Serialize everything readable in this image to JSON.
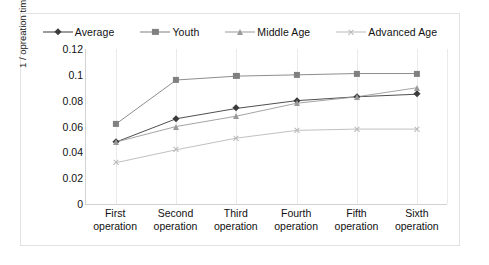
{
  "chart_data": {
    "type": "line",
    "title": "",
    "xlabel": "",
    "ylabel": "1 / opreation time (sec)",
    "categories": [
      "First operation",
      "Second operation",
      "Third operation",
      "Fourth operation",
      "Fifth operation",
      "Sixth operation"
    ],
    "category_lines": [
      [
        "First",
        "operation"
      ],
      [
        "Second",
        "operation"
      ],
      [
        "Third",
        "operation"
      ],
      [
        "Fourth",
        "operation"
      ],
      [
        "Fifth",
        "operation"
      ],
      [
        "Sixth",
        "operation"
      ]
    ],
    "ylim": [
      0,
      0.12
    ],
    "yticks": [
      "0",
      "0.02",
      "0.04",
      "0.06",
      "0.08",
      "0.1",
      "0.12"
    ],
    "ytick_values": [
      0,
      0.02,
      0.04,
      0.06,
      0.08,
      0.1,
      0.12
    ],
    "grid": "vertical",
    "legend_position": "top",
    "series": [
      {
        "name": "Average",
        "marker": "diamond",
        "color": "#3b3b3b",
        "values": [
          0.048,
          0.066,
          0.074,
          0.08,
          0.083,
          0.085
        ]
      },
      {
        "name": "Youth",
        "marker": "square",
        "color": "#808080",
        "values": [
          0.062,
          0.096,
          0.099,
          0.1,
          0.101,
          0.101
        ]
      },
      {
        "name": "Middle Age",
        "marker": "triangle",
        "color": "#9a9a9a",
        "values": [
          0.048,
          0.06,
          0.068,
          0.078,
          0.083,
          0.09
        ]
      },
      {
        "name": "Advanced Age",
        "marker": "cross",
        "color": "#b9b9b9",
        "values": [
          0.032,
          0.042,
          0.051,
          0.057,
          0.058,
          0.058
        ]
      }
    ]
  }
}
